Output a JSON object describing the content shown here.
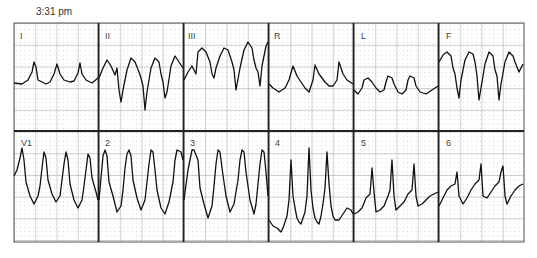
{
  "header": {
    "timestamp": "3:31 pm"
  },
  "colors": {
    "trace": "#111111",
    "major_grid": "#9a9a9a",
    "minor_grid": "#c8c8c8",
    "divider": "#222222",
    "background": "#ffffff"
  },
  "layout": {
    "grid_left": 14,
    "grid_right": 524,
    "grid_top": 23,
    "grid_mid": 131,
    "grid_bottom": 242,
    "panel_width": 85,
    "major_cell": 21.5
  },
  "leads": {
    "top": [
      {
        "id": "I",
        "label": "I"
      },
      {
        "id": "II",
        "label": "II"
      },
      {
        "id": "III",
        "label": "III"
      },
      {
        "id": "aVR",
        "label": "R"
      },
      {
        "id": "aVL",
        "label": "L"
      },
      {
        "id": "aVF",
        "label": "F"
      }
    ],
    "bottom": [
      {
        "id": "V1",
        "label": "V1"
      },
      {
        "id": "V2",
        "label": "2"
      },
      {
        "id": "V3",
        "label": "3"
      },
      {
        "id": "V4",
        "label": "4"
      },
      {
        "id": "V5",
        "label": "5"
      },
      {
        "id": "V6",
        "label": "6"
      }
    ]
  },
  "traces": {
    "I": "0,83 8,84 14,80 18,72 20,62 22,67 24,80 28,82 32,84 36,82 40,74 43,64 46,74 50,80 56,82 60,81 64,73 66,63 68,74 72,80 78,83 84,78",
    "II": "0,78 4,68 8,60 12,66 16,75 18,68 20,90 22,102 24,90 28,70 32,58 36,62 40,72 42,78 44,86 46,110 48,92 52,68 56,58 60,62 62,74 64,82 66,98 68,92 72,66 76,56 80,62 84,68",
    "III": "0,80 4,72 8,66 12,74 14,52 18,48 22,52 26,62 28,74 30,78 32,68 36,56 40,48 44,50 48,62 50,70 52,90 56,68 60,50 64,42 68,48 70,60 72,68 74,72 76,86 78,66 82,46 84,42",
    "aVR": "0,84 4,88 10,92 16,88 20,80 24,66 28,76 32,82 36,88 40,92 44,80 46,65 50,74 56,82 60,86 64,86 68,80 70,62 74,74 78,80 84,84",
    "aVL": "0,90 4,94 8,88 10,80 14,78 18,82 22,88 26,92 30,90 32,82 34,76 38,78 40,84 44,92 48,94 52,90 54,80 56,76 60,78 62,86 66,92 72,94 78,90 84,86",
    "aVF": "0,62 4,55 8,52 12,56 14,68 16,74 18,88 20,98 22,80 26,60 30,52 34,54 36,62 38,76 40,100 42,88 46,64 50,52 54,56 56,70 58,76 60,100 62,84 66,62 70,52 74,56 76,62 80,72 84,64",
    "V1": "0,176 3,170 6,158 8,148 10,160 12,182 16,196 20,204 24,196 26,186 28,168 30,152 32,158 34,180 38,194 42,202 46,196 48,180 50,164 52,152 54,160 56,184 60,200 64,208 68,200 70,186 72,170 74,154 76,158 78,178 82,192 84,200",
    "V2": "0,200 2,178 4,156 6,150 8,156 10,182 14,196 18,212 22,206 24,190 26,168 28,154 30,150 32,156 34,180 38,198 42,210 46,200 48,182 50,164 52,150 54,152 56,170 58,190 62,208 66,214 70,202 74,182 76,160 78,150 82,152 84,160",
    "V3": "0,200 4,170 8,150 10,150 14,160 16,188 20,204 24,218 28,206 30,186 32,164 34,150 36,152 38,168 42,196 46,212 50,204 54,180 56,160 58,150 60,152 62,172 66,200 70,214 72,204 74,184 76,164 78,150 80,152 82,172 84,196",
    "V4": "0,220 4,226 8,228 12,232 14,228 18,216 20,200 22,160 24,196 26,208 28,218 30,222 32,224 34,218 36,212 38,196 40,148 42,190 44,208 46,218 48,222 50,224 52,216 54,204 56,188 58,152 60,184 62,206 64,216 66,220 70,220 74,214 78,208 82,210 84,214",
    "V5": "0,214 4,212 8,208 12,198 16,194 18,168 20,192 22,212 26,210 30,206 34,196 36,190 38,160 40,196 42,210 46,206 50,202 54,194 58,190 60,164 62,196 64,206 68,204 72,200 76,196 80,194 84,192",
    "V6": "0,206 4,198 8,190 12,186 16,184 18,172 20,196 24,204 28,198 32,190 36,184 40,180 42,164 44,196 48,198 52,192 56,186 60,182 62,172 64,166 66,196 68,204 72,196 76,190 80,186 84,184"
  }
}
